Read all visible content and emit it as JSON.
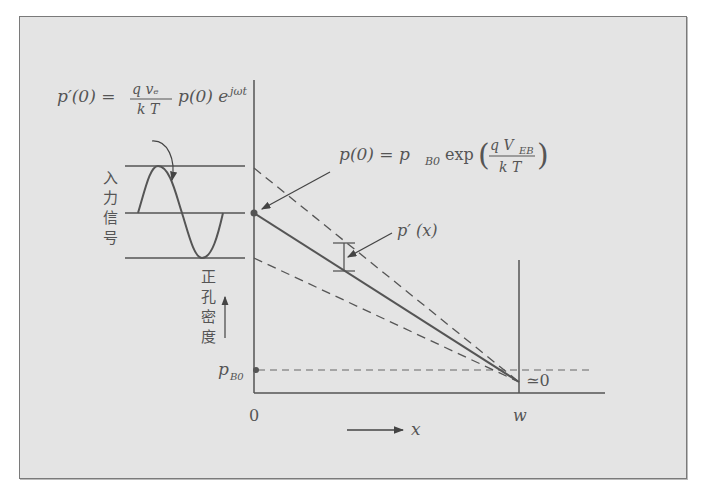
{
  "diagram": {
    "formulas": {
      "signal_formula": {
        "lhs": "p′(0) =",
        "numerator": "q vₑ",
        "denominator": "k T",
        "rhs": "p(0) e",
        "exponent": "jωt"
      },
      "boundary_formula": {
        "lhs": "p(0) = p",
        "lhs_sub": "B0",
        "func": "exp",
        "numerator": "q V",
        "numerator_sub": "EB",
        "denominator": "k T"
      },
      "perturbation_label": "p′ (x)"
    },
    "labels": {
      "input_signal": [
        "入",
        "力",
        "信",
        "号"
      ],
      "hole_density": [
        "正",
        "孔",
        "密",
        "度"
      ],
      "p_b0": "p",
      "p_b0_sub": "B0",
      "approx_zero": "≃0",
      "origin": "0",
      "w": "w",
      "x_axis": "x"
    },
    "colors": {
      "background": "#e4e4e4",
      "line": "#555555",
      "frame": "#7a7a7a"
    }
  }
}
